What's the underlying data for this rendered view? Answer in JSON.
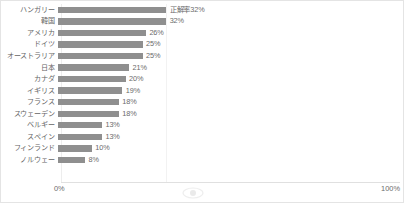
{
  "chart_data": {
    "type": "bar",
    "orientation": "horizontal",
    "title": "",
    "xlabel": "",
    "ylabel": "",
    "xlim": [
      0,
      100
    ],
    "grid": false,
    "legend": "none",
    "series_label": "正解率",
    "categories": [
      "ハンガリー",
      "韓国",
      "アメリカ",
      "ドイツ",
      "オーストラリア",
      "日本",
      "カナダ",
      "イギリス",
      "フランス",
      "スウェーデン",
      "ベルギー",
      "スペイン",
      "フィンランド",
      "ノルウェー"
    ],
    "values": [
      32,
      32,
      26,
      25,
      25,
      21,
      20,
      19,
      18,
      18,
      13,
      13,
      10,
      8
    ],
    "data_labels": [
      "正解率32%",
      "32%",
      "26%",
      "25%",
      "25%",
      "21%",
      "20%",
      "19%",
      "18%",
      "18%",
      "13%",
      "13%",
      "10%",
      "8%"
    ],
    "tick_labels": [
      "0%",
      "100%"
    ],
    "bar_color": "#8f8f8f",
    "text_color": "#6b6b6b",
    "border_color": "#e4e4e4",
    "background": "#ffffff"
  },
  "axis": {
    "min_tick": "0%",
    "max_tick": "100%"
  },
  "watermark": {
    "name": "eye-watermark"
  }
}
